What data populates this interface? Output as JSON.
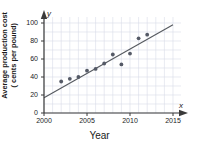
{
  "chart_data": {
    "type": "scatter",
    "title": "",
    "xlabel": "Year",
    "ylabel": "Average production cost (cents per pound)",
    "ylabel_lines": [
      "Average production cost",
      "( cents per pound)"
    ],
    "x_axis_variable": "x",
    "y_axis_variable": "y",
    "xlim": [
      2000,
      2015
    ],
    "ylim": [
      0,
      100
    ],
    "xticks": [
      2000,
      2005,
      2010,
      2015
    ],
    "xtick_labels": [
      "2000",
      "2005",
      "2010",
      "2015"
    ],
    "yticks": [
      0,
      20,
      40,
      60,
      80,
      100
    ],
    "ytick_labels": [
      "0",
      "20",
      "40",
      "60",
      "80",
      "100"
    ],
    "grid": true,
    "grid_color": "#d8dce8",
    "legend": null,
    "point_color": "#555a66",
    "line_color": "#55595f",
    "axis_color": "#3a3a3a",
    "points": [
      {
        "x": 2002,
        "y": 35
      },
      {
        "x": 2003,
        "y": 38
      },
      {
        "x": 2004,
        "y": 40
      },
      {
        "x": 2005,
        "y": 47
      },
      {
        "x": 2006,
        "y": 49
      },
      {
        "x": 2007,
        "y": 55
      },
      {
        "x": 2008,
        "y": 65
      },
      {
        "x": 2009,
        "y": 54
      },
      {
        "x": 2010,
        "y": 66
      },
      {
        "x": 2011,
        "y": 83
      },
      {
        "x": 2012,
        "y": 87
      }
    ],
    "trend_line": {
      "x_start": 2000,
      "y_start": 17,
      "x_end": 2015,
      "y_end": 98
    }
  }
}
